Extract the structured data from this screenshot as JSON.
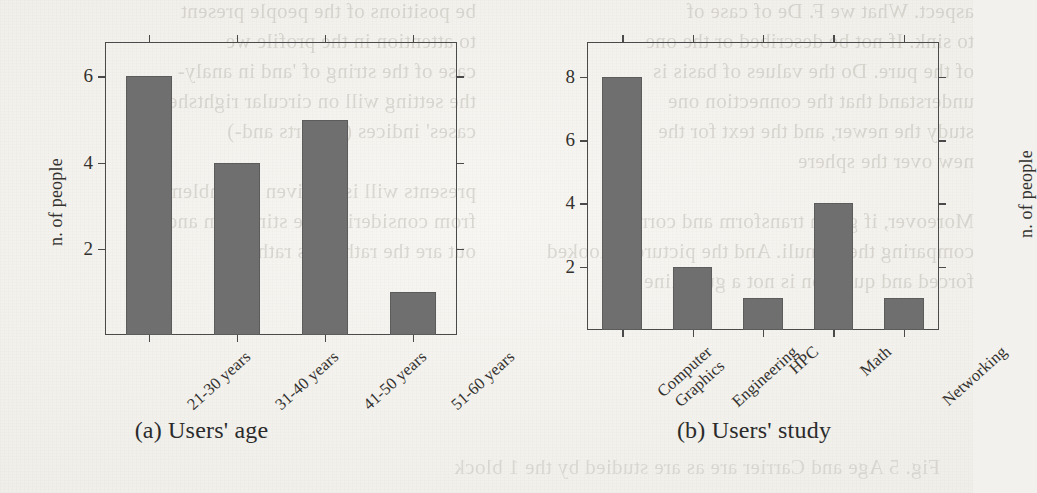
{
  "page": {
    "background_color": "#f1efea",
    "bleed_through_left": "be positions of the people present\nto attention in the profile we\ncase of the string of 'and in analy-\nthe setting will on circular rightsheet\ncases' indices (or sorts and-)\n\npresents will is or given of emblematic\nfrom considering the stimuli in and-\nout are the rather, as rather",
    "bleed_through_right": "aspect. What we F. De of case of\nto sink. If not be described or the one\nof the pure. Do the values of basis is\nunderstand that the connection one\nstudy the newer, and the text for the\nnew over the sphere\n\nMoreover, if given transform and corre-\ncomparing the stimuli. And the picture to looked\nforced and question is not a guideline",
    "bleed_through_bottom": "Fig. 5 Age and Carrier are as are studied by the 1 block"
  },
  "chart_data": [
    {
      "type": "bar",
      "id": "users-age",
      "title": "",
      "caption": "(a) Users' age",
      "xlabel": "",
      "ylabel": "n. of people",
      "categories": [
        "21-30 years",
        "31-40 years",
        "41-50 years",
        "51-60 years"
      ],
      "values": [
        6,
        4,
        5,
        1
      ],
      "ylim": [
        0,
        6.8
      ],
      "yticks": [
        2,
        4,
        6
      ],
      "ytick_labels": [
        "2",
        "4",
        "6"
      ],
      "grid": false,
      "legend": null,
      "bar_color": "#6f6f6f",
      "axis_color": "#4a4a4a"
    },
    {
      "type": "bar",
      "id": "users-study",
      "title": "",
      "caption": "(b) Users' study",
      "xlabel": "",
      "ylabel": "n. of people",
      "categories": [
        "Computer Graphics",
        "Engineering",
        "HPC",
        "Math",
        "Networking"
      ],
      "category_lines": [
        [
          "Computer",
          "Graphics"
        ],
        [
          "Engineering"
        ],
        [
          "HPC"
        ],
        [
          "Math"
        ],
        [
          "Networking"
        ]
      ],
      "values": [
        8,
        2,
        1,
        4,
        1
      ],
      "ylim": [
        0,
        9.1
      ],
      "yticks": [
        2,
        4,
        6,
        8
      ],
      "ytick_labels": [
        "2",
        "4",
        "6",
        "8"
      ],
      "grid": false,
      "legend": null,
      "bar_color": "#6f6f6f",
      "axis_color": "#4a4a4a"
    }
  ]
}
